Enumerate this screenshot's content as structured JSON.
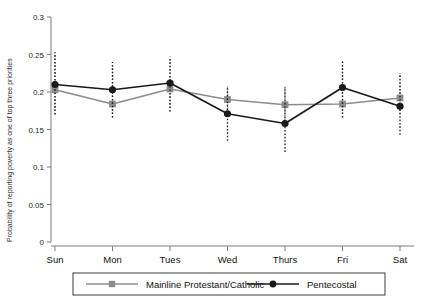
{
  "chart_data": {
    "type": "line",
    "title": "",
    "xlabel": "",
    "ylabel": "Probability of reporting poverty as one of top three priorities",
    "categories": [
      "Sun",
      "Mon",
      "Tues",
      "Wed",
      "Thurs",
      "Fri",
      "Sat"
    ],
    "ylim": [
      0,
      0.3
    ],
    "yticks": [
      0,
      0.05,
      0.1,
      0.15,
      0.2,
      0.25,
      0.3
    ],
    "ytick_labels": [
      "0",
      "0.05",
      "0.1",
      "0.15",
      "0.2",
      "0.25",
      "0.3"
    ],
    "grid": false,
    "legend_position": "bottom",
    "error_bars": "dotted vertical 95% confidence intervals",
    "series": [
      {
        "name": "Mainline Protestant/Catholic",
        "color": "#8c8c8c",
        "marker": "square",
        "values": [
          0.203,
          0.184,
          0.204,
          0.19,
          0.183,
          0.184,
          0.192
        ],
        "ci_low": [
          0.17,
          0.166,
          0.174,
          0.168,
          0.163,
          0.166,
          0.17
        ],
        "ci_high": [
          0.253,
          0.24,
          0.247,
          0.208,
          0.207,
          0.242,
          0.225
        ]
      },
      {
        "name": "Pentecostal",
        "color": "#1a1a1a",
        "marker": "circle",
        "values": [
          0.21,
          0.203,
          0.212,
          0.171,
          0.158,
          0.206,
          0.181
        ],
        "ci_low": [
          0.17,
          0.166,
          0.174,
          0.135,
          0.12,
          0.166,
          0.143
        ],
        "ci_high": [
          0.253,
          0.24,
          0.247,
          0.208,
          0.207,
          0.242,
          0.225
        ]
      }
    ]
  },
  "legend": {
    "entries": [
      {
        "label": "Mainline Protestant/Catholic"
      },
      {
        "label": "Pentecostal"
      }
    ]
  }
}
